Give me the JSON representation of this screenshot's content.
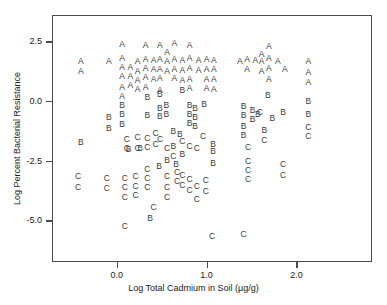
{
  "chart_data": {
    "type": "scatter",
    "title": "",
    "xlabel": "Log Total Cadmium in Soil (µg/g)",
    "ylabel": "Log Percent Bacterial Resistance",
    "xlim": [
      -0.72,
      2.84
    ],
    "ylim": [
      -6.75,
      3.6
    ],
    "xticks": [
      0.0,
      1.0,
      2.0
    ],
    "xtick_labels": [
      "0.0",
      "1.0",
      "2.0"
    ],
    "yticks": [
      2.5,
      0.0,
      -2.5,
      -5.0
    ],
    "ytick_labels": [
      "2.5",
      "0.0",
      "-2.5",
      "-5.0"
    ],
    "grid": false,
    "legend": "none",
    "marker_style": "letter-coded",
    "series": [
      {
        "name": "A",
        "marker": "A",
        "points": [
          [
            -0.41,
            1.73
          ],
          [
            -0.41,
            1.3
          ],
          [
            -0.1,
            1.72
          ],
          [
            0.05,
            2.42
          ],
          [
            0.05,
            1.83
          ],
          [
            0.05,
            1.45
          ],
          [
            0.05,
            1.07
          ],
          [
            0.05,
            0.62
          ],
          [
            0.05,
            0.25
          ],
          [
            0.14,
            1.45
          ],
          [
            0.14,
            1.08
          ],
          [
            0.14,
            0.7
          ],
          [
            0.22,
            1.7
          ],
          [
            0.22,
            1.3
          ],
          [
            0.22,
            0.9
          ],
          [
            0.22,
            0.55
          ],
          [
            0.31,
            2.4
          ],
          [
            0.31,
            1.8
          ],
          [
            0.31,
            1.42
          ],
          [
            0.31,
            1.03
          ],
          [
            0.31,
            0.62
          ],
          [
            0.4,
            1.76
          ],
          [
            0.4,
            1.36
          ],
          [
            0.4,
            0.95
          ],
          [
            0.47,
            2.38
          ],
          [
            0.47,
            1.78
          ],
          [
            0.47,
            1.38
          ],
          [
            0.47,
            1.0
          ],
          [
            0.47,
            0.52
          ],
          [
            0.55,
            2.1
          ],
          [
            0.55,
            1.72
          ],
          [
            0.55,
            1.3
          ],
          [
            0.63,
            2.48
          ],
          [
            0.63,
            1.8
          ],
          [
            0.63,
            1.4
          ],
          [
            0.63,
            1.02
          ],
          [
            0.72,
            1.75
          ],
          [
            0.72,
            1.34
          ],
          [
            0.72,
            0.93
          ],
          [
            0.8,
            2.4
          ],
          [
            0.8,
            1.82
          ],
          [
            0.8,
            1.42
          ],
          [
            0.8,
            0.98
          ],
          [
            0.8,
            0.6
          ],
          [
            0.9,
            1.74
          ],
          [
            0.9,
            1.35
          ],
          [
            0.99,
            1.78
          ],
          [
            0.99,
            1.38
          ],
          [
            0.99,
            0.98
          ],
          [
            0.99,
            0.58
          ],
          [
            1.07,
            1.76
          ],
          [
            1.07,
            1.36
          ],
          [
            1.07,
            0.96
          ],
          [
            1.07,
            0.56
          ],
          [
            1.36,
            1.72
          ],
          [
            1.44,
            1.8
          ],
          [
            1.44,
            1.38
          ],
          [
            1.53,
            1.75
          ],
          [
            1.6,
            2.02
          ],
          [
            1.6,
            1.73
          ],
          [
            1.6,
            1.3
          ],
          [
            1.68,
            2.35
          ],
          [
            1.68,
            1.84
          ],
          [
            1.68,
            1.42
          ],
          [
            1.68,
            0.95
          ],
          [
            1.78,
            1.7
          ],
          [
            1.86,
            1.4
          ],
          [
            2.12,
            1.72
          ],
          [
            2.12,
            1.24
          ],
          [
            2.12,
            0.85
          ]
        ]
      },
      {
        "name": "B",
        "marker": "B",
        "points": [
          [
            -0.41,
            -1.7
          ],
          [
            -0.1,
            -0.65
          ],
          [
            -0.1,
            -1.1
          ],
          [
            0.05,
            -0.12
          ],
          [
            0.05,
            -0.5
          ],
          [
            0.05,
            -0.92
          ],
          [
            0.33,
            0.22
          ],
          [
            0.33,
            -0.55
          ],
          [
            0.47,
            0.32
          ],
          [
            0.47,
            -0.25
          ],
          [
            0.47,
            -0.6
          ],
          [
            0.54,
            -0.12
          ],
          [
            0.54,
            -0.52
          ],
          [
            0.72,
            0.52
          ],
          [
            0.62,
            -1.22
          ],
          [
            0.69,
            -1.35
          ],
          [
            0.8,
            -0.15
          ],
          [
            0.8,
            -0.52
          ],
          [
            0.8,
            -0.88
          ],
          [
            0.86,
            -0.25
          ],
          [
            0.86,
            -0.62
          ],
          [
            0.86,
            -1.02
          ],
          [
            0.96,
            -0.1
          ],
          [
            0.62,
            -1.85
          ],
          [
            0.72,
            -2.18
          ],
          [
            0.55,
            -2.45
          ],
          [
            0.65,
            -2.62
          ],
          [
            1.06,
            -1.78
          ],
          [
            1.06,
            -2.05
          ],
          [
            1.06,
            -2.55
          ],
          [
            0.46,
            -2.7
          ],
          [
            0.12,
            -1.98
          ],
          [
            0.25,
            -1.92
          ],
          [
            1.4,
            -0.18
          ],
          [
            1.4,
            -0.55
          ],
          [
            1.4,
            -1.02
          ],
          [
            1.4,
            -1.38
          ],
          [
            1.5,
            -0.35
          ],
          [
            1.5,
            -0.72
          ],
          [
            1.56,
            -0.52
          ],
          [
            1.63,
            -1.18
          ],
          [
            1.67,
            0.3
          ],
          [
            1.72,
            -0.68
          ],
          [
            1.84,
            -0.42
          ],
          [
            2.12,
            0.05
          ],
          [
            2.12,
            -0.5
          ],
          [
            0.36,
            -4.88
          ]
        ]
      },
      {
        "name": "C",
        "marker": "C",
        "points": [
          [
            -0.44,
            -3.12
          ],
          [
            -0.44,
            -3.55
          ],
          [
            -0.12,
            -3.2
          ],
          [
            -0.12,
            -3.62
          ],
          [
            0.1,
            -1.55
          ],
          [
            0.1,
            -1.95
          ],
          [
            0.22,
            -1.48
          ],
          [
            0.22,
            -1.92
          ],
          [
            0.33,
            -1.5
          ],
          [
            0.33,
            -1.88
          ],
          [
            0.42,
            -1.3
          ],
          [
            0.42,
            -1.78
          ],
          [
            0.47,
            -1.55
          ],
          [
            0.55,
            -1.95
          ],
          [
            0.62,
            -2.25
          ],
          [
            0.72,
            -1.62
          ],
          [
            0.8,
            -1.85
          ],
          [
            0.88,
            -1.95
          ],
          [
            0.95,
            -1.42
          ],
          [
            0.08,
            -3.18
          ],
          [
            0.08,
            -3.55
          ],
          [
            0.08,
            -3.98
          ],
          [
            0.08,
            -5.18
          ],
          [
            0.2,
            -3.12
          ],
          [
            0.2,
            -3.52
          ],
          [
            0.2,
            -3.92
          ],
          [
            0.33,
            -2.8
          ],
          [
            0.33,
            -3.2
          ],
          [
            0.33,
            -3.58
          ],
          [
            0.4,
            -4.42
          ],
          [
            0.55,
            -3.12
          ],
          [
            0.55,
            -3.55
          ],
          [
            0.55,
            -3.98
          ],
          [
            0.66,
            -2.92
          ],
          [
            0.66,
            -3.32
          ],
          [
            0.72,
            -3.08
          ],
          [
            0.72,
            -3.5
          ],
          [
            0.8,
            -3.25
          ],
          [
            0.8,
            -3.68
          ],
          [
            0.88,
            -3.52
          ],
          [
            0.88,
            -4.08
          ],
          [
            0.98,
            -3.28
          ],
          [
            0.98,
            -3.72
          ],
          [
            1.05,
            -5.62
          ],
          [
            1.4,
            -5.55
          ],
          [
            1.45,
            -1.9
          ],
          [
            1.45,
            -2.48
          ],
          [
            1.45,
            -2.85
          ],
          [
            1.45,
            -3.22
          ],
          [
            1.58,
            -0.42
          ],
          [
            1.63,
            -1.6
          ],
          [
            1.84,
            -2.62
          ],
          [
            1.84,
            -3.08
          ],
          [
            2.12,
            -1.05
          ],
          [
            2.12,
            -1.42
          ]
        ]
      }
    ]
  }
}
